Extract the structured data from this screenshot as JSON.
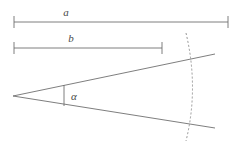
{
  "figure": {
    "background_color": "#ffffff",
    "line_color": "#6f6f6f",
    "label_color": "#4a4a4a",
    "width": 241,
    "height": 150,
    "dimensions": [
      {
        "name": "a",
        "label": "a",
        "label_x": 66,
        "label_y": 16,
        "line_y": 22,
        "x_start": 14,
        "x_end": 228,
        "tick_half_height": 6
      },
      {
        "name": "b",
        "label": "b",
        "label_x": 71,
        "label_y": 42,
        "line_y": 48,
        "x_start": 14,
        "x_end": 162,
        "tick_half_height": 6
      }
    ],
    "angle": {
      "label": "α",
      "label_x": 74,
      "label_y": 100,
      "vertex_x": 13,
      "vertex_y": 96,
      "upper_ray_end_x": 215,
      "upper_ray_end_y": 54,
      "lower_ray_end_x": 215,
      "lower_ray_end_y": 128,
      "marker_x": 64,
      "marker_y_top": 85,
      "marker_y_bottom": 106
    },
    "arc": {
      "name": "wavefront-arc",
      "style": "dashed",
      "dash_pattern": "2,2",
      "start_x": 186,
      "start_y": 33,
      "control_x": 199,
      "control_y": 88,
      "end_x": 186,
      "end_y": 141
    }
  }
}
